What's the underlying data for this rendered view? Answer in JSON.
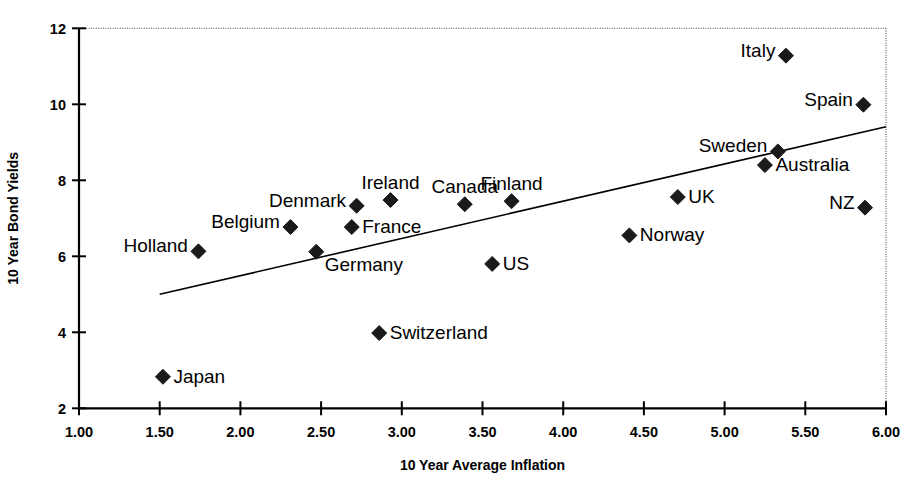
{
  "chart_data": {
    "type": "scatter",
    "title": "",
    "xlabel": "10 Year Average Inflation",
    "ylabel": "10 Year Bond Yields",
    "xlim": [
      1.0,
      6.0
    ],
    "ylim": [
      2,
      12
    ],
    "xticks": [
      "1.00",
      "1.50",
      "2.00",
      "2.50",
      "3.00",
      "3.50",
      "4.00",
      "4.50",
      "5.00",
      "5.50",
      "6.00"
    ],
    "xtick_values": [
      1.0,
      1.5,
      2.0,
      2.5,
      3.0,
      3.5,
      4.0,
      4.5,
      5.0,
      5.5,
      6.0
    ],
    "yticks": [
      "2",
      "4",
      "6",
      "8",
      "10",
      "12"
    ],
    "ytick_values": [
      2,
      4,
      6,
      8,
      10,
      12
    ],
    "grid": false,
    "legend": "none",
    "marker_shape": "diamond",
    "marker_color": "#1a1a1a",
    "points": [
      {
        "label": "Japan",
        "x": 1.52,
        "y": 2.83,
        "label_pos": "right"
      },
      {
        "label": "Holland",
        "x": 1.74,
        "y": 6.13,
        "label_pos": "left"
      },
      {
        "label": "Belgium",
        "x": 2.31,
        "y": 6.77,
        "label_pos": "left"
      },
      {
        "label": "Denmark",
        "x": 2.72,
        "y": 7.33,
        "label_pos": "left"
      },
      {
        "label": "France",
        "x": 2.69,
        "y": 6.77,
        "label_pos": "right"
      },
      {
        "label": "Switzerland",
        "x": 2.86,
        "y": 3.98,
        "label_pos": "right"
      },
      {
        "label": "Germany",
        "x": 2.47,
        "y": 6.12,
        "label_pos": "right-below"
      },
      {
        "label": "Ireland",
        "x": 2.93,
        "y": 7.48,
        "label_pos": "above"
      },
      {
        "label": "Canada",
        "x": 3.39,
        "y": 7.37,
        "label_pos": "above"
      },
      {
        "label": "US",
        "x": 3.56,
        "y": 5.8,
        "label_pos": "right"
      },
      {
        "label": "Finland",
        "x": 3.68,
        "y": 7.45,
        "label_pos": "above"
      },
      {
        "label": "Norway",
        "x": 4.41,
        "y": 6.55,
        "label_pos": "right"
      },
      {
        "label": "UK",
        "x": 4.71,
        "y": 7.56,
        "label_pos": "right"
      },
      {
        "label": "Australia",
        "x": 5.25,
        "y": 8.4,
        "label_pos": "right"
      },
      {
        "label": "Sweden",
        "x": 5.33,
        "y": 8.76,
        "label_pos": "left"
      },
      {
        "label": "Italy",
        "x": 5.38,
        "y": 11.28,
        "label_pos": "left"
      },
      {
        "label": "Spain",
        "x": 5.86,
        "y": 9.99,
        "label_pos": "left"
      },
      {
        "label": "NZ",
        "x": 5.87,
        "y": 7.28,
        "label_pos": "left"
      }
    ],
    "trendline": {
      "x_start": 1.5,
      "y_start": 5.0,
      "x_end": 6.0,
      "y_end": 9.41
    }
  }
}
